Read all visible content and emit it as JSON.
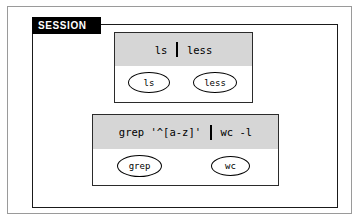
{
  "figure": {
    "label": "SESSION",
    "pipelines": [
      {
        "id": "pipeline-ls-less",
        "command_parts": {
          "left": "ls",
          "pipe": "|",
          "right": "less"
        },
        "command_full": "ls | less",
        "nodes": [
          {
            "label": "ls"
          },
          {
            "label": "less"
          }
        ]
      },
      {
        "id": "pipeline-grep-wc",
        "command_parts": {
          "left": "grep '^[a-z]'",
          "pipe": "|",
          "right": "wc -l"
        },
        "command_full": "grep '^[a-z]' | wc -l",
        "nodes": [
          {
            "label": "grep"
          },
          {
            "label": "wc"
          }
        ]
      }
    ],
    "colors": {
      "header_fill": "#d6d6d6",
      "tab_fill": "#000000",
      "tab_text": "#ffffff",
      "stroke": "#000000",
      "background": "#ffffff"
    }
  }
}
